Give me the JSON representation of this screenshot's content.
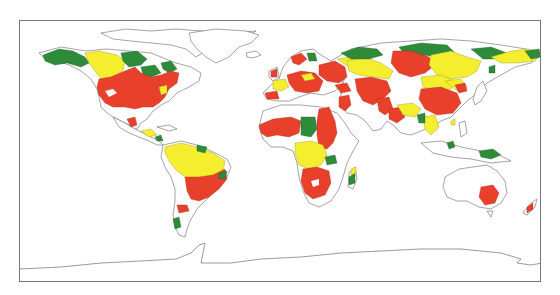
{
  "map": {
    "type": "world-choropleth",
    "projection": "equirectangular",
    "frame": {
      "x": 19,
      "y": 20,
      "width": 522,
      "height": 262
    },
    "legend": null,
    "title": null,
    "categories": [
      {
        "name": "red",
        "color": "#e8402a"
      },
      {
        "name": "yellow",
        "color": "#f5ee2e"
      },
      {
        "name": "green",
        "color": "#2e8b3a"
      },
      {
        "name": "unshaded",
        "color": "#ffffff"
      }
    ],
    "regions": {
      "north_america": [
        "green: Alaska, northern Canada (Nunavut/Quebec/Labrador)",
        "yellow: western Canada",
        "red: contiguous United States, southern Canada, Mexico patches"
      ],
      "central_america": [
        "yellow/green patches"
      ],
      "south_america": [
        "yellow: Amazon basin, northern SA",
        "red: southern Brazil, Paraguay, Uruguay, parts of Chile",
        "green: small patches in northeast and southern Chile"
      ],
      "europe": [
        "red: Scandinavia patches, central/eastern Europe",
        "yellow: France/Iberia patches"
      ],
      "africa": [
        "red: West Africa, Nile/East Africa, southern Africa",
        "green: central Africa (Chad/Sudan), Madagascar",
        "yellow: Congo basin"
      ],
      "asia": [
        "green: northern Siberia, Russian Far East",
        "yellow: Siberia, Kazakhstan, Mongolia, Indochina",
        "red: western Siberia, Middle East, Central Asia, Pakistan, China"
      ],
      "oceania": [
        "red: southeastern Australia, New Zealand",
        "green: New Guinea"
      ]
    }
  }
}
